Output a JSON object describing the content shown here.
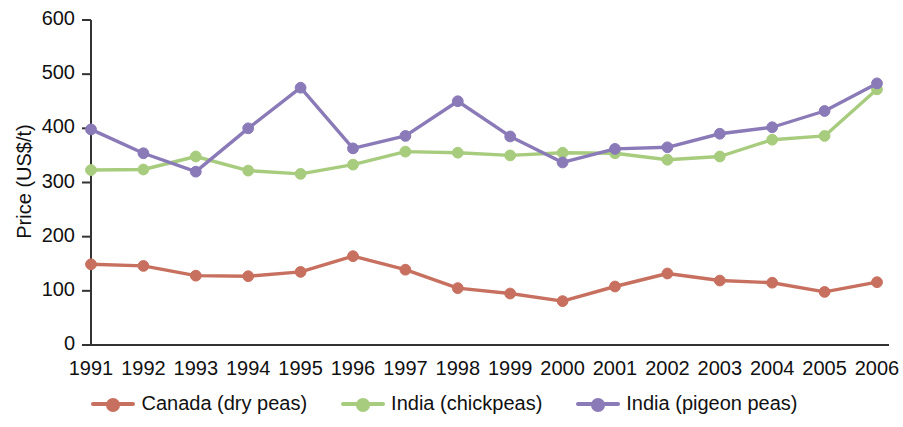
{
  "chart_data": {
    "type": "line",
    "title": "",
    "xlabel": "",
    "ylabel": "Price (US$/t)",
    "x": [
      1991,
      1992,
      1993,
      1994,
      1995,
      1996,
      1997,
      1998,
      1999,
      2000,
      2001,
      2002,
      2003,
      2004,
      2005,
      2006
    ],
    "categories": [
      "1991",
      "1992",
      "1993",
      "1994",
      "1995",
      "1996",
      "1997",
      "1998",
      "1999",
      "2000",
      "2001",
      "2002",
      "2003",
      "2004",
      "2005",
      "2006"
    ],
    "ylim": [
      0,
      600
    ],
    "yticks": [
      0,
      100,
      200,
      300,
      400,
      500,
      600
    ],
    "ytick_labels": [
      "0",
      "100",
      "200",
      "300",
      "400",
      "500",
      "600"
    ],
    "grid": false,
    "legend_position": "bottom",
    "series": [
      {
        "name": "Canada (dry peas)",
        "color": "#c8705f",
        "values": [
          149,
          146,
          128,
          127,
          135,
          164,
          139,
          105,
          95,
          81,
          108,
          132,
          119,
          115,
          98,
          116
        ]
      },
      {
        "name": "India (chickpeas)",
        "color": "#a8cc7e",
        "values": [
          323,
          324,
          348,
          322,
          316,
          333,
          357,
          355,
          350,
          355,
          354,
          342,
          348,
          379,
          386,
          472
        ]
      },
      {
        "name": "India (pigeon peas)",
        "color": "#8a7ab8",
        "values": [
          398,
          354,
          320,
          400,
          475,
          363,
          386,
          450,
          385,
          337,
          362,
          365,
          390,
          402,
          432,
          483
        ]
      }
    ]
  },
  "legend": {
    "items": [
      {
        "label": "Canada (dry peas)",
        "color": "#c8705f"
      },
      {
        "label": "India (chickpeas)",
        "color": "#a8cc7e"
      },
      {
        "label": "India (pigeon peas)",
        "color": "#8a7ab8"
      }
    ]
  },
  "axes": {
    "y_title": "Price (US$/t)"
  }
}
